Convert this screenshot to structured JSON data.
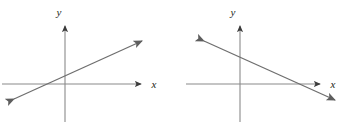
{
  "figure": {
    "width": 358,
    "height": 126,
    "background": "#ffffff",
    "axis_color": "#8a8a8a",
    "line_color": "#6e6e6e",
    "label_color": "#231f20"
  },
  "panels": [
    {
      "id": "left",
      "name": "positive-slope-graph",
      "description": "Coordinate plane with a straight line of positive slope",
      "axes": {
        "x": {
          "label": "x",
          "start": [
            2,
            84
          ],
          "end": [
            148,
            84
          ],
          "arrow_at_end": true
        },
        "y": {
          "label": "y",
          "start": [
            65,
            122
          ],
          "end": [
            65,
            20
          ],
          "arrow_at_end": true
        },
        "origin": [
          65,
          84
        ]
      },
      "line": {
        "name": "line-positive-slope",
        "from": [
          10,
          101
        ],
        "to": [
          147,
          38
        ],
        "arrow_start": true,
        "arrow_end": true,
        "slope_sign": "positive"
      },
      "label_positions": {
        "x": [
          154,
          88
        ],
        "y": [
          58,
          13
        ]
      }
    },
    {
      "id": "right",
      "name": "negative-slope-graph",
      "description": "Coordinate plane with a straight line of negative slope",
      "axes": {
        "x": {
          "label": "x",
          "start": [
            7,
            84
          ],
          "end": [
            148,
            84
          ],
          "arrow_at_end": true
        },
        "y": {
          "label": "y",
          "start": [
            61,
            122
          ],
          "end": [
            61,
            20
          ],
          "arrow_at_end": true
        },
        "origin": [
          61,
          84
        ]
      },
      "line": {
        "name": "line-negative-slope",
        "from": [
          20,
          38
        ],
        "to": [
          161,
          103
        ],
        "arrow_start": true,
        "arrow_end": true,
        "slope_sign": "negative"
      },
      "label_positions": {
        "x": [
          154,
          88
        ],
        "y": [
          53,
          13
        ]
      }
    }
  ]
}
